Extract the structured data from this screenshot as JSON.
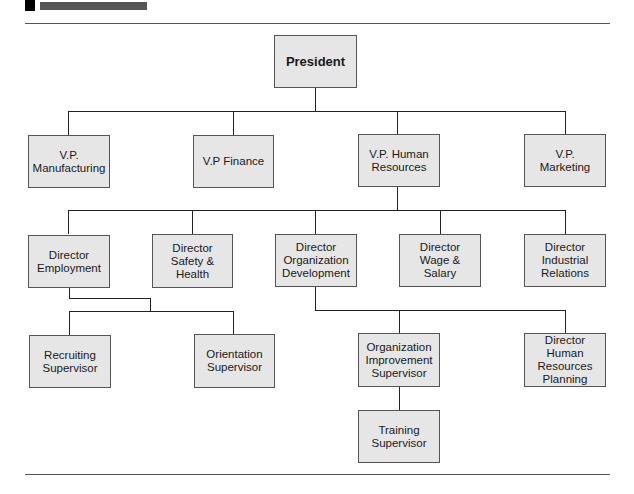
{
  "header": {
    "marker_color": "#000000",
    "bar_color": "#555555"
  },
  "chart": {
    "type": "org-chart",
    "node_fill": "#e6e6e6",
    "node_border": "#555555",
    "connector_color": "#222222"
  },
  "nodes": {
    "president": {
      "label": "President"
    },
    "vp_manufacturing": {
      "label": "V.P.\nManufacturing"
    },
    "vp_finance": {
      "label": "V.P Finance"
    },
    "vp_human_resources": {
      "label": "V.P. Human\nResources"
    },
    "vp_marketing": {
      "label": "V.P.\nMarketing"
    },
    "director_employment": {
      "label": "Director\nEmployment"
    },
    "director_safety_health": {
      "label": "Director\nSafety &\nHealth"
    },
    "director_org_development": {
      "label": "Director\nOrganization\nDevelopment"
    },
    "director_wage_salary": {
      "label": "Director\nWage &\nSalary"
    },
    "director_industrial_relations": {
      "label": "Director\nIndustrial\nRelations"
    },
    "recruiting_supervisor": {
      "label": "Recruiting\nSupervisor"
    },
    "orientation_supervisor": {
      "label": "Orientation\nSupervisor"
    },
    "org_improvement_supervisor": {
      "label": "Organization\nImprovement\nSupervisor"
    },
    "director_hr_planning": {
      "label": "Director\nHuman\nResources\nPlanning"
    },
    "training_supervisor": {
      "label": "Training\nSupervisor"
    }
  },
  "hierarchy": {
    "President": [
      "V.P. Manufacturing",
      "V.P Finance",
      "V.P. Human Resources",
      "V.P. Marketing"
    ],
    "V.P. Human Resources": [
      "Director Employment",
      "Director Safety & Health",
      "Director Organization Development",
      "Director Wage & Salary",
      "Director Industrial Relations"
    ],
    "Director Employment": [
      "Recruiting Supervisor",
      "Orientation Supervisor"
    ],
    "Director Organization Development": [
      "Organization Improvement Supervisor",
      "Director Human Resources Planning"
    ],
    "Organization Improvement Supervisor": [
      "Training Supervisor"
    ]
  }
}
